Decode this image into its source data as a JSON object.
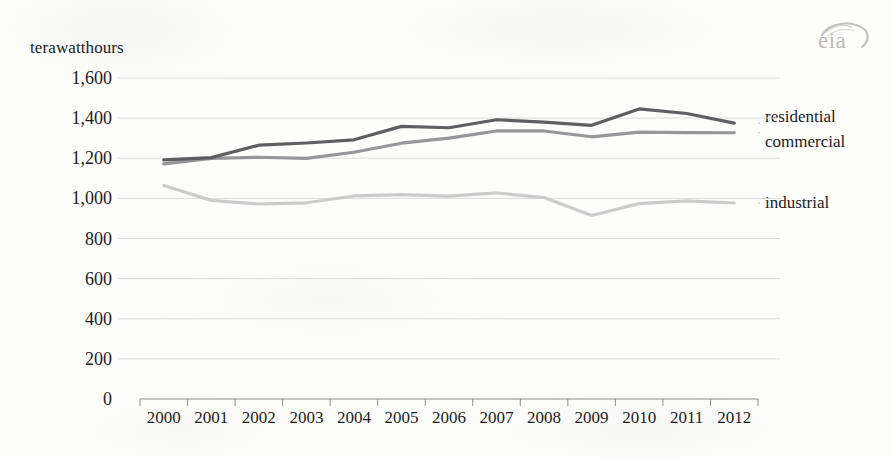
{
  "logo": {
    "text": "eia",
    "icon": "eia-swoosh-icon"
  },
  "chart_data": {
    "type": "line",
    "title": "",
    "xlabel": "",
    "ylabel": "terawatthours",
    "ylim": [
      0,
      1600
    ],
    "yticks": [
      "0",
      "200",
      "400",
      "600",
      "800",
      "1,000",
      "1,200",
      "1,400",
      "1,600"
    ],
    "ytick_values": [
      0,
      200,
      400,
      600,
      800,
      1000,
      1200,
      1400,
      1600
    ],
    "grid": true,
    "legend_position": "right-inline-labels",
    "categories": [
      "2000",
      "2001",
      "2002",
      "2003",
      "2004",
      "2005",
      "2006",
      "2007",
      "2008",
      "2009",
      "2010",
      "2011",
      "2012"
    ],
    "x": [
      2000,
      2001,
      2002,
      2003,
      2004,
      2005,
      2006,
      2007,
      2008,
      2009,
      2010,
      2011,
      2012
    ],
    "series": [
      {
        "name": "residential",
        "color": "#56565a",
        "values": [
          1192,
          1203,
          1265,
          1276,
          1292,
          1359,
          1352,
          1392,
          1380,
          1364,
          1446,
          1423,
          1375
        ]
      },
      {
        "name": "commercial",
        "color": "#919194",
        "values": [
          1172,
          1199,
          1205,
          1199,
          1230,
          1275,
          1300,
          1336,
          1336,
          1307,
          1330,
          1328,
          1327
        ]
      },
      {
        "name": "industrial",
        "color": "#c9c9c9",
        "values": [
          1064,
          990,
          972,
          978,
          1012,
          1019,
          1011,
          1027,
          1004,
          915,
          974,
          988,
          977
        ]
      }
    ]
  }
}
